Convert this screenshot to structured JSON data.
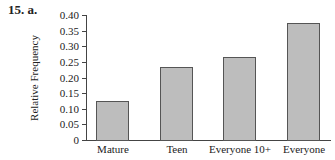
{
  "problem": {
    "label": "15.  a."
  },
  "chart_data": {
    "type": "bar",
    "title": "",
    "xlabel": "",
    "ylabel": "Relative Frequency",
    "categories": [
      "Mature",
      "Teen",
      "Everyone 10+",
      "Everyone"
    ],
    "values": [
      0.125,
      0.233,
      0.266,
      0.374
    ],
    "ylim": [
      0,
      0.4
    ],
    "yticks": [
      "0",
      "0.05",
      "0.10",
      "0.15",
      "0.20",
      "0.25",
      "0.30",
      "0.35",
      "0.40"
    ],
    "grid": false,
    "legend": null,
    "bar_color": "#bdbdbd",
    "bar_edge_color": "#555555"
  }
}
